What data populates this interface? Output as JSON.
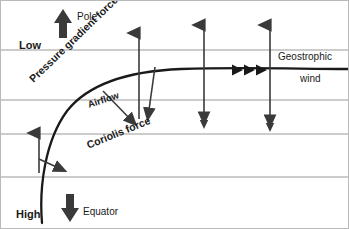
{
  "diagram": {
    "background_color": "#ffffff",
    "border_color": "#b9b9b9",
    "isobar_color": "#9a9a9a",
    "ink_color": "#1a1a1a",
    "labels": {
      "low": "Low",
      "high": "High",
      "pole": "Pole",
      "equator": "Equator",
      "pressure_gradient_force": "Pressure gradient force",
      "coriolis_force": "Coriolis force",
      "airflow": "Airflow",
      "geostrophic_wind_line1": "Geostrophic",
      "geostrophic_wind_line2": "wind"
    },
    "isobars": {
      "count": 4,
      "y_positions": [
        49,
        99,
        133,
        176
      ]
    },
    "vectors": {
      "pole_arrow": {
        "label": "Pole",
        "direction": "up",
        "x": 62,
        "y_top": 10,
        "y_bottom": 36
      },
      "equator_arrow": {
        "label": "Equator",
        "direction": "down",
        "x": 69,
        "y_top": 194,
        "y_bottom": 220
      },
      "pgf_arrows": [
        {
          "x": 38,
          "y_top": 130,
          "y_bottom": 172,
          "direction": "up"
        },
        {
          "x": 138,
          "y_top": 30,
          "y_bottom": 118,
          "direction": "up"
        },
        {
          "x": 203,
          "y_top": 22,
          "y_bottom": 120,
          "direction": "both"
        },
        {
          "x": 269,
          "y_top": 22,
          "y_bottom": 123,
          "direction": "both"
        }
      ],
      "coriolis_arrows": [
        {
          "x1": 40,
          "y1": 160,
          "x2": 66,
          "y2": 171
        },
        {
          "x1": 104,
          "y1": 92,
          "x2": 137,
          "y2": 126
        },
        {
          "x1": 153,
          "y1": 68,
          "x2": 146,
          "y2": 120
        }
      ],
      "geostrophic_arrowheads": {
        "count": 3,
        "x_positions": [
          236,
          248,
          260
        ],
        "y": 69
      }
    },
    "airflow_path": {
      "description": "curved trajectory from High at bottom-left turning right to geostrophic wind",
      "start": [
        41,
        214
      ],
      "end": [
        330,
        68
      ]
    }
  }
}
